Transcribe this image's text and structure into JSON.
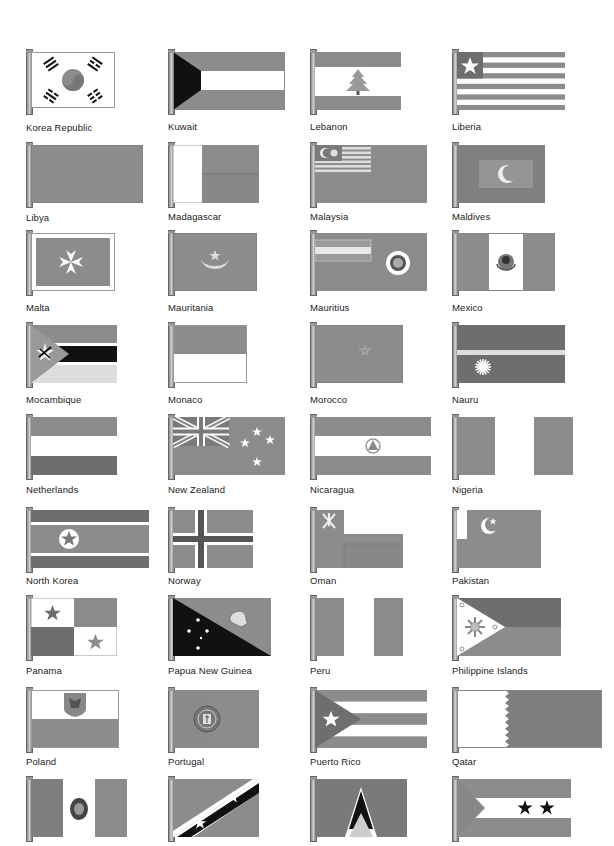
{
  "page": {
    "colors": {
      "gray": "#8c8c8c",
      "dark": "#6e6e6e",
      "light": "#d8d8d8",
      "black": "#111111",
      "white": "#ffffff"
    },
    "flags": [
      {
        "name": "Korea Republic"
      },
      {
        "name": "Kuwait"
      },
      {
        "name": "Lebanon"
      },
      {
        "name": "Liberia"
      },
      {
        "name": "Libya"
      },
      {
        "name": "Madagascar"
      },
      {
        "name": "Malaysia"
      },
      {
        "name": "Maldives"
      },
      {
        "name": "Malta"
      },
      {
        "name": "Mauritania"
      },
      {
        "name": "Mauritius"
      },
      {
        "name": "Mexico"
      },
      {
        "name": "Mocambique"
      },
      {
        "name": "Monaco"
      },
      {
        "name": "Morocco"
      },
      {
        "name": "Nauru"
      },
      {
        "name": "Netherlands"
      },
      {
        "name": "New Zealand"
      },
      {
        "name": "Nicaragua"
      },
      {
        "name": "Nigeria"
      },
      {
        "name": "North Korea"
      },
      {
        "name": "Norway"
      },
      {
        "name": "Oman"
      },
      {
        "name": "Pakistan"
      },
      {
        "name": "Panama"
      },
      {
        "name": "Papua New Guinea"
      },
      {
        "name": "Peru"
      },
      {
        "name": "Philippine Islands"
      },
      {
        "name": "Poland"
      },
      {
        "name": "Portugal"
      },
      {
        "name": "Puerto Rico"
      },
      {
        "name": "Qatar"
      },
      {
        "name": ""
      },
      {
        "name": ""
      },
      {
        "name": ""
      },
      {
        "name": ""
      }
    ]
  }
}
